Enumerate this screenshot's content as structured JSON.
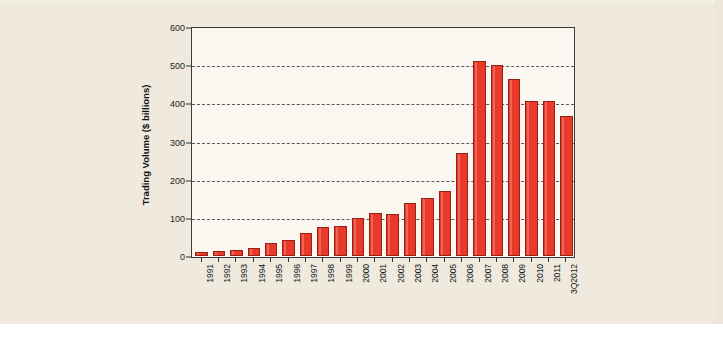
{
  "page": {
    "background_color": "#efeadd",
    "footer_caption": ""
  },
  "chart_data": {
    "type": "bar",
    "title": "",
    "xlabel": "",
    "ylabel": "Trading Volume ($ billions)",
    "ylim": [
      0,
      600
    ],
    "yticks": [
      0,
      100,
      200,
      300,
      400,
      500,
      600
    ],
    "ytick_labels": [
      "0",
      "100",
      "200",
      "300",
      "400",
      "500",
      "600"
    ],
    "grid": true,
    "grid_style": "dashed horizontal",
    "legend": null,
    "bar_color": "#e8392b",
    "bar_edge_color": "#9c1f14",
    "plot_background": "#faf7f1",
    "categories": [
      "1991",
      "1992",
      "1993",
      "1994",
      "1995",
      "1996",
      "1997",
      "1998",
      "1999",
      "2000",
      "2001",
      "2002",
      "2003",
      "2004",
      "2005",
      "2006",
      "2007",
      "2008",
      "2009",
      "2010",
      "2011",
      "3Q2012"
    ],
    "values": [
      10,
      12,
      16,
      22,
      34,
      41,
      60,
      75,
      78,
      100,
      113,
      109,
      140,
      152,
      170,
      270,
      511,
      500,
      463,
      405,
      406,
      367
    ]
  }
}
